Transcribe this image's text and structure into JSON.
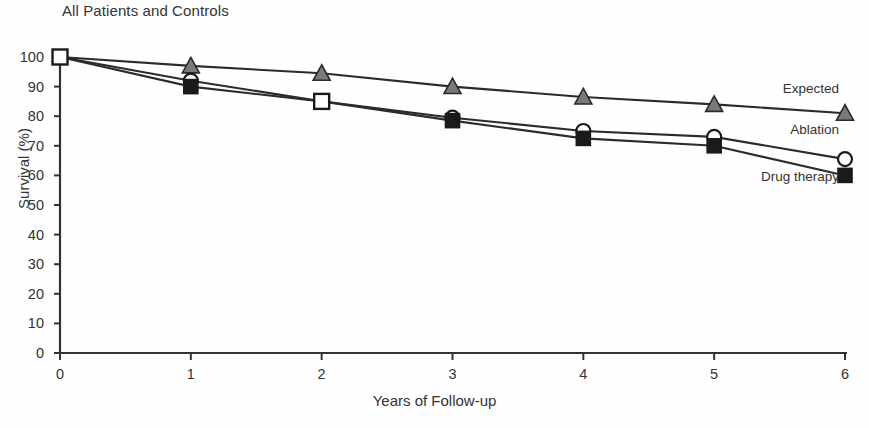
{
  "chart_data": {
    "type": "line",
    "title": "All Patients and Controls",
    "xlabel": "Years of Follow-up",
    "ylabel": "Survival (%)",
    "x": [
      0,
      1,
      2,
      3,
      4,
      5,
      6
    ],
    "xticks": [
      "0",
      "1",
      "2",
      "3",
      "4",
      "5",
      "6"
    ],
    "yticks": [
      "0",
      "10",
      "20",
      "30",
      "40",
      "50",
      "60",
      "70",
      "80",
      "90",
      "100"
    ],
    "xlim": [
      0,
      6
    ],
    "ylim": [
      0,
      100
    ],
    "grid": false,
    "legend_position": "inline-right",
    "series": [
      {
        "name": "Expected",
        "marker": "triangle-filled",
        "color": "#6e6e6e",
        "values": [
          100,
          97,
          94.5,
          90,
          86.5,
          84,
          81
        ],
        "label_x": 6,
        "label_y": 89
      },
      {
        "name": "Ablation",
        "marker": "circle-open",
        "color": "#1a1a1a",
        "values": [
          100,
          92,
          85,
          79.5,
          75,
          73,
          65.5
        ],
        "label_x": 6,
        "label_y": 75
      },
      {
        "name": "Drug therapy",
        "marker": "square-filled",
        "color": "#1a1a1a",
        "values": [
          100,
          90,
          85,
          78.5,
          72.5,
          70,
          60
        ],
        "label_x": 6,
        "label_y": 59
      }
    ],
    "origin_marker": "square-open"
  }
}
